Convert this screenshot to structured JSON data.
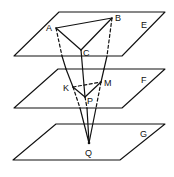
{
  "diagram": {
    "type": "geometry-3d-parallel-planes",
    "planes": [
      {
        "id": "E",
        "label": "E"
      },
      {
        "id": "F",
        "label": "F"
      },
      {
        "id": "G",
        "label": "G"
      }
    ],
    "points": [
      {
        "id": "A",
        "label": "A",
        "plane": "E"
      },
      {
        "id": "B",
        "label": "B",
        "plane": "E"
      },
      {
        "id": "C",
        "label": "C",
        "plane": "E"
      },
      {
        "id": "K",
        "label": "K",
        "plane": "F"
      },
      {
        "id": "M",
        "label": "M",
        "plane": "F"
      },
      {
        "id": "P",
        "label": "P",
        "plane": "F"
      },
      {
        "id": "Q",
        "label": "Q",
        "plane": "G"
      }
    ],
    "segments": [
      {
        "from": "A",
        "to": "B",
        "style": "solid"
      },
      {
        "from": "B",
        "to": "C",
        "style": "solid"
      },
      {
        "from": "A",
        "to": "C",
        "style": "solid"
      },
      {
        "from": "K",
        "to": "M",
        "style": "dashed"
      },
      {
        "from": "K",
        "to": "P",
        "style": "solid"
      },
      {
        "from": "M",
        "to": "P",
        "style": "solid"
      },
      {
        "from": "A",
        "to": "Q",
        "style": "dashed",
        "through": "K"
      },
      {
        "from": "B",
        "to": "Q",
        "style": "dashed",
        "through": "M"
      },
      {
        "from": "C",
        "to": "Q",
        "style": "solid",
        "through": "P"
      }
    ],
    "colors": {
      "line": "#111111",
      "background": "#ffffff"
    }
  },
  "labels": {
    "E": "E",
    "F": "F",
    "G": "G",
    "A": "A",
    "B": "B",
    "C": "C",
    "K": "K",
    "M": "M",
    "P": "P",
    "Q": "Q"
  }
}
